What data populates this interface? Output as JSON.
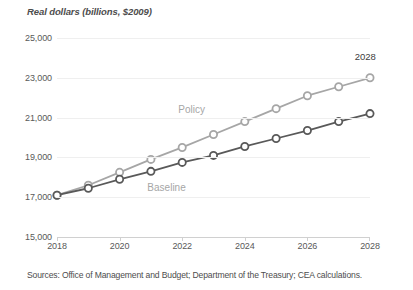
{
  "chart_data": {
    "type": "line",
    "title": "Real dollars (billions, $2009)",
    "xlabel": "",
    "ylabel": "Real dollars (billions, $2009)",
    "x": [
      2018,
      2019,
      2020,
      2021,
      2022,
      2023,
      2024,
      2025,
      2026,
      2027,
      2028
    ],
    "xtick_labels": [
      "2018",
      "2020",
      "2022",
      "2024",
      "2026",
      "2028"
    ],
    "xticks": [
      2018,
      2020,
      2022,
      2024,
      2026,
      2028
    ],
    "ytick_labels": [
      "15,000",
      "17,000",
      "19,000",
      "21,000",
      "23,000",
      "25,000"
    ],
    "yticks": [
      15000,
      17000,
      19000,
      21000,
      23000,
      25000
    ],
    "ylim": [
      15000,
      25000
    ],
    "xlim": [
      2018,
      2028
    ],
    "grid": true,
    "legend_position": "inline-labels",
    "series": [
      {
        "name": "Policy",
        "color": "#a6a6a6",
        "label_x": 2022.3,
        "label_y": 21450,
        "values": [
          17100,
          17600,
          18250,
          18900,
          19500,
          20150,
          20800,
          21450,
          22100,
          22550,
          23000
        ]
      },
      {
        "name": "Baseline",
        "color": "#595959",
        "label_x": 2021.5,
        "label_y": 17500,
        "values": [
          17100,
          17450,
          17900,
          18300,
          18750,
          19100,
          19550,
          19950,
          20350,
          20800,
          21200
        ]
      }
    ],
    "annotations": [
      {
        "text": "2028",
        "x": 2027.85,
        "y": 24100
      }
    ]
  },
  "sources": {
    "text": "Sources: Office of Management and Budget; Department of the Treasury; CEA calculations."
  },
  "colors": {
    "policy": "#a6a6a6",
    "baseline": "#595959",
    "grid": "#efefef",
    "axis": "#d0d0d0",
    "text": "#595959"
  }
}
